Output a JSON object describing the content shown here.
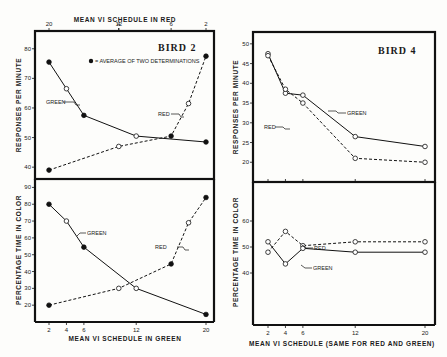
{
  "chart_data": [
    {
      "type": "line",
      "panel": "bird2-top",
      "title": "BIRD 2",
      "annotation": "● = AVERAGE OF TWO DETERMINATIONS",
      "xlabel_top": "MEAN VI SCHEDULE IN RED",
      "xlabel_bottom": "MEAN VI SCHEDULE IN GREEN",
      "ylabel": "RESPONSES PER MINUTE",
      "x_ticks_bottom": [
        2,
        4,
        6,
        12,
        20
      ],
      "x_ticks_top": [
        20,
        12,
        6,
        4,
        2
      ],
      "y_ticks": [
        40,
        50,
        60,
        70,
        80
      ],
      "ylim": [
        36,
        86
      ],
      "xlim": [
        0,
        21
      ],
      "series": [
        {
          "name": "GREEN",
          "style": "solid",
          "x": [
            2,
            4,
            6,
            12,
            20
          ],
          "y": [
            75.5,
            66.5,
            57.5,
            50.5,
            48.5
          ],
          "filled": [
            true,
            false,
            true,
            false,
            true
          ]
        },
        {
          "name": "RED",
          "style": "dashed",
          "x": [
            2,
            10,
            16,
            18,
            20
          ],
          "y": [
            39,
            47,
            50.5,
            61.5,
            77.5
          ],
          "filled": [
            true,
            false,
            true,
            false,
            true
          ]
        }
      ]
    },
    {
      "type": "line",
      "panel": "bird2-bottom",
      "ylabel": "PERCENTAGE TIME IN COLOR",
      "xlabel": "MEAN VI SCHEDULE IN GREEN",
      "x_ticks": [
        2,
        4,
        6,
        12,
        20
      ],
      "y_ticks": [
        20,
        30,
        40,
        50,
        60,
        70,
        80,
        90
      ],
      "ylim": [
        10,
        95
      ],
      "series": [
        {
          "name": "GREEN",
          "style": "solid",
          "x": [
            2,
            4,
            6,
            12,
            20
          ],
          "y": [
            80,
            70,
            54.5,
            30,
            14.5
          ],
          "filled": [
            true,
            false,
            true,
            false,
            true
          ]
        },
        {
          "name": "RED",
          "style": "dashed",
          "x": [
            2,
            10,
            16,
            18,
            20
          ],
          "y": [
            20,
            30,
            44.5,
            69,
            84
          ],
          "filled": [
            true,
            false,
            true,
            false,
            true
          ]
        }
      ]
    },
    {
      "type": "line",
      "panel": "bird4-top",
      "title": "BIRD 4",
      "ylabel": "RESPONSES PER MINUTE",
      "y_ticks": [
        20,
        25,
        30,
        35,
        40,
        45,
        50
      ],
      "ylim": [
        15,
        53
      ],
      "series": [
        {
          "name": "GREEN",
          "style": "solid",
          "x": [
            2,
            4,
            6,
            12,
            20
          ],
          "y": [
            47.5,
            37.5,
            37,
            26.5,
            24
          ]
        },
        {
          "name": "RED",
          "style": "dashed",
          "x": [
            2,
            4,
            6,
            12,
            20
          ],
          "y": [
            47,
            38.5,
            35,
            21,
            20
          ]
        }
      ]
    },
    {
      "type": "line",
      "panel": "bird4-bottom",
      "ylabel": "PERCENTAGE TIME IN COLOR",
      "xlabel": "MEAN VI SCHEDULE (SAME FOR RED AND GREEN)",
      "x_ticks": [
        2,
        4,
        6,
        12,
        20
      ],
      "y_ticks": [
        40,
        50,
        60
      ],
      "ylim": [
        20,
        75
      ],
      "series": [
        {
          "name": "RED",
          "style": "dashed",
          "x": [
            2,
            4,
            6,
            12,
            20
          ],
          "y": [
            48,
            56,
            50.5,
            52,
            52
          ]
        },
        {
          "name": "GREEN",
          "style": "solid",
          "x": [
            2,
            4,
            6,
            12,
            20
          ],
          "y": [
            52,
            43.5,
            49.5,
            48,
            48
          ]
        }
      ]
    }
  ],
  "labels": {
    "bird2": "BIRD 2",
    "bird4": "BIRD 4",
    "legend_note": "= AVERAGE OF TWO DETERMINATIONS",
    "top_axis_red": "MEAN VI SCHEDULE IN RED",
    "bottom_axis_green": "MEAN VI SCHEDULE IN GREEN",
    "bottom_axis_same": "MEAN VI SCHEDULE (SAME FOR RED AND GREEN)",
    "y_responses": "RESPONSES PER MINUTE",
    "y_percentage": "PERCENTAGE TIME IN COLOR",
    "green": "GREEN",
    "red": "RED"
  }
}
